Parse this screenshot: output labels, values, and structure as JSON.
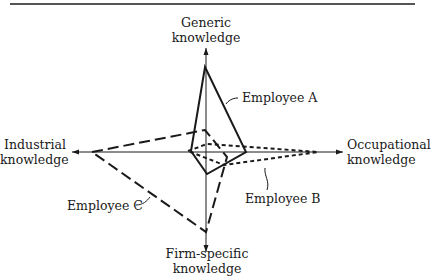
{
  "figure": {
    "type": "radar-diagram",
    "center": [
      206,
      152
    ]
  },
  "axes": {
    "top": {
      "line1": "Generic",
      "line2": "knowledge"
    },
    "right": {
      "line1": "Occupational",
      "line2": "knowledge"
    },
    "bottom": {
      "line1": "Firm-specific",
      "line2": "knowledge"
    },
    "left": {
      "line1": "Industrial",
      "line2": "knowledge"
    }
  },
  "series": [
    {
      "name": "Employee A",
      "line_style": "solid",
      "color": "#1a1a1a",
      "profile": {
        "generic": "high",
        "occupational": "low-medium",
        "firm_specific": "low",
        "industrial": "very low"
      }
    },
    {
      "name": "Employee B",
      "line_style": "short-dash",
      "color": "#1a1a1a",
      "profile": {
        "generic": "very low",
        "occupational": "high",
        "firm_specific": "low",
        "industrial": "very low"
      }
    },
    {
      "name": "Employee C",
      "line_style": "long-dash",
      "color": "#1a1a1a",
      "profile": {
        "generic": "low",
        "occupational": "low",
        "firm_specific": "high",
        "industrial": "high"
      }
    }
  ],
  "labels": {
    "employee_a": "Employee A",
    "employee_b": "Employee B",
    "employee_c": "Employee C"
  }
}
